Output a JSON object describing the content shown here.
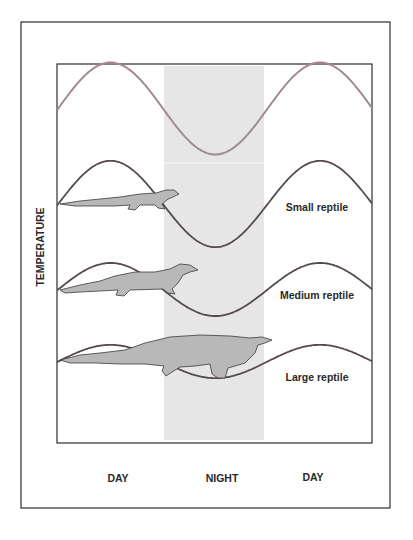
{
  "chart_data": {
    "type": "line",
    "title": "",
    "xlabel": "",
    "ylabel": "TEMPERATURE",
    "categories": [
      "DAY",
      "NIGHT",
      "DAY"
    ],
    "x_range_hours": [
      0,
      48
    ],
    "shaded_region": {
      "label": "night",
      "x_start_fraction": 0.34,
      "x_end_fraction": 0.66,
      "color": "#e6e6e6"
    },
    "grid": false,
    "series": [
      {
        "name": "Environment",
        "label": "",
        "color": "#a08c8e",
        "peak_phase_fraction": 0.17,
        "relative_amplitude": 1.0,
        "period_fraction": 0.665
      },
      {
        "name": "Small reptile",
        "label": "Small reptile",
        "color": "#574a4d",
        "peak_phase_fraction": 0.17,
        "relative_amplitude": 0.96,
        "period_fraction": 0.665
      },
      {
        "name": "Medium reptile",
        "label": "Medium reptile",
        "color": "#574a4d",
        "peak_phase_fraction": 0.17,
        "relative_amplitude": 0.59,
        "period_fraction": 0.665
      },
      {
        "name": "Large reptile",
        "label": "Large reptile",
        "color": "#574a4d",
        "peak_phase_fraction": 0.17,
        "relative_amplitude": 0.37,
        "period_fraction": 0.665
      }
    ],
    "annotations": [
      "Small reptile",
      "Medium reptile",
      "Large reptile"
    ]
  },
  "colors": {
    "frame": "#2e2e2e",
    "night_band": "#e6e6e6",
    "reptile_fill": "#b8b8b8",
    "reptile_outline": "#3a3a3a"
  }
}
